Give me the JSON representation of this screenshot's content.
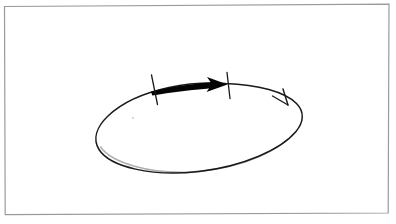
{
  "document": {
    "title": "Hand-drawn circular loop with directed arc",
    "background_color": "#ffffff",
    "width": 396,
    "height": 224
  },
  "frame": {
    "name": "page-border",
    "stroke_color": "#9a9a9e",
    "stroke_width": 1.2,
    "left": 4,
    "top": 5,
    "right": 389,
    "bottom": 214,
    "tilt_note": "slightly skewed, hand-scanned"
  },
  "diagram": {
    "type": "freehand-sketch",
    "ink_color": "#1a1a1a",
    "elements": [
      {
        "name": "ellipse-loop",
        "label": "circle drawn in perspective",
        "stroke_color": "#1a1a1a",
        "stroke_width": 1.5,
        "center_x": 199,
        "center_y": 127,
        "radius_x": 103,
        "radius_y": 45
      },
      {
        "name": "direction-arrowhead",
        "label": "clockwise direction marker",
        "stroke_color": "#1a1a1a",
        "stroke_width": 1.4,
        "tip_x": 287,
        "tip_y": 104,
        "style": "open-v"
      },
      {
        "name": "bold-arc-arrow",
        "label": "bold arrow spanning arc segment",
        "fill_color": "#050505",
        "start_x": 152,
        "start_y": 91,
        "end_x": 225,
        "end_y": 83,
        "style": "tapered-solid"
      },
      {
        "name": "tick-mark-left",
        "label": "left endpoint tick",
        "stroke_color": "#1a1a1a",
        "stroke_width": 1.3,
        "x_top": 152,
        "y_top": 75,
        "x_bottom": 158,
        "y_bottom": 104
      },
      {
        "name": "tick-mark-right",
        "label": "right endpoint tick",
        "stroke_color": "#1a1a1a",
        "stroke_width": 1.3,
        "x_top": 228,
        "y_top": 73,
        "x_bottom": 230,
        "y_bottom": 98
      },
      {
        "name": "ink-speck",
        "label": "faint scan artifact",
        "color": "#cfcfcf",
        "x": 133,
        "y": 118
      }
    ]
  },
  "accessibility": {
    "figure_description": "A hand-drawn ellipse representing a circle viewed at an angle. A thin open arrowhead on the right side of the ellipse indicates clockwise motion. Along the upper arc, a thick solid arrow points to the right, bounded at each end by a short tick mark marking the arc segment."
  }
}
